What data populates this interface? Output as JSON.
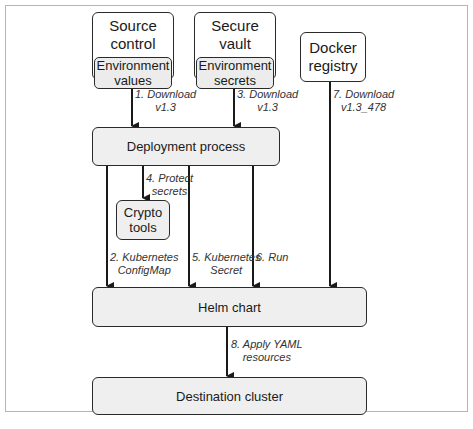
{
  "diagram": {
    "nodes": {
      "source_control": {
        "title": "Source control",
        "inner": "Environment values"
      },
      "secure_vault": {
        "title": "Secure vault",
        "inner": "Environment secrets"
      },
      "docker_registry": {
        "title": "Docker registry"
      },
      "deployment_process": {
        "title": "Deployment process"
      },
      "crypto_tools": {
        "title": "Crypto tools"
      },
      "helm_chart": {
        "title": "Helm chart"
      },
      "destination_cluster": {
        "title": "Destination cluster"
      }
    },
    "edges": {
      "e1": {
        "line1": "1. Download",
        "line2": "v1.3"
      },
      "e2": {
        "line1": "2. Kubernetes",
        "line2": "ConfigMap"
      },
      "e3": {
        "line1": "3. Download",
        "line2": "v1.3"
      },
      "e4": {
        "line1": "4. Protect",
        "line2": "secrets"
      },
      "e5": {
        "line1": "5. Kubernetes",
        "line2": "Secret"
      },
      "e6": {
        "line1": "6. Run",
        "line2": ""
      },
      "e7": {
        "line1": "7. Download",
        "line2": "v1.3_478"
      },
      "e8": {
        "line1": "8. Apply YAML",
        "line2": "resources"
      }
    },
    "colors": {
      "stroke": "#2a2a2a",
      "fill_gray": "#efefef",
      "frame": "#b5b5b5"
    }
  }
}
